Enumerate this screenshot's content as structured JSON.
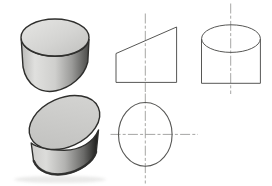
{
  "figure": {
    "type": "engineering-drawing",
    "views": [
      {
        "id": "pictorial-cylinder",
        "label": "shaded pictorial view of full cylinder"
      },
      {
        "id": "pictorial-truncated-cylinder",
        "label": "shaded pictorial view of truncated cylinder"
      },
      {
        "id": "front-view",
        "label": "front view (trapezoid with vertical centerline)"
      },
      {
        "id": "top-view",
        "label": "top view (circle with crosshair centerlines)"
      },
      {
        "id": "side-view",
        "label": "side view (rectangle with ellipse and vertical centerline)"
      }
    ]
  },
  "colors": {
    "background": "#ffffff",
    "outline": "#2f2f2d",
    "line": "#575755",
    "centerline": "#8f8f8d",
    "shadow": "#c6c6c4",
    "cyl_top_0": "#e6e6e4",
    "cyl_top_1": "#d4d4d2",
    "cyl_top_2": "#c0c0be",
    "cyl_body_0": "#b9b9b7",
    "cyl_body_1": "#e0e0de",
    "cyl_body_2": "#cfcfcd",
    "cyl_body_3": "#9a9a98",
    "cyl_body_4": "#636361",
    "cyl_body_5": "#4a4a48",
    "cut_face_0": "#d6d6d4",
    "cut_face_1": "#bfbfbd",
    "trunc_body_0": "#cecdcb",
    "trunc_body_1": "#dcdcda",
    "trunc_body_2": "#b3b3b1",
    "trunc_body_3": "#6a6a68",
    "trunc_body_4": "#181816"
  }
}
